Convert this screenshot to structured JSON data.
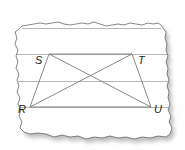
{
  "diagram": {
    "type": "trapezoid-with-diagonals",
    "background": "torn-lined-paper",
    "colors": {
      "paper": "#ffffff",
      "paper_edge": "#555555",
      "shadow": "#bdbdbd",
      "rule_line": "#b8b8b8",
      "figure_line": "#7a7a7a",
      "label": "#222222"
    },
    "vertices": [
      {
        "id": "S",
        "label": "S",
        "x": 49,
        "y": 54
      },
      {
        "id": "T",
        "label": "T",
        "x": 132,
        "y": 54
      },
      {
        "id": "U",
        "label": "U",
        "x": 151,
        "y": 107
      },
      {
        "id": "R",
        "label": "R",
        "x": 30,
        "y": 107
      }
    ],
    "segments": [
      {
        "from": "R",
        "to": "S"
      },
      {
        "from": "S",
        "to": "T"
      },
      {
        "from": "T",
        "to": "U"
      },
      {
        "from": "U",
        "to": "R"
      },
      {
        "from": "S",
        "to": "U"
      },
      {
        "from": "T",
        "to": "R"
      }
    ],
    "labels": {
      "S": "S",
      "T": "T",
      "R": "R",
      "U": "U"
    }
  }
}
